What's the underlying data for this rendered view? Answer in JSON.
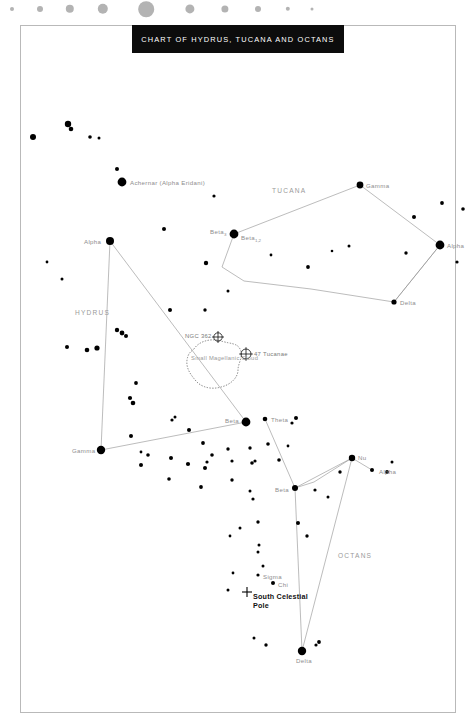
{
  "chart_data": {
    "type": "scatter",
    "title": "CHART OF HYDRUS, TUCANA AND OCTANS",
    "subtitle": "",
    "xlabel": "",
    "ylabel": "",
    "grid": false,
    "legend_position": "top",
    "magnitude_key": {
      "name": "star-magnitude-key",
      "color": "#b3b3b3",
      "dot_radii": [
        2.0,
        3.0,
        4.2,
        5.2,
        7.8,
        4.6,
        3.6,
        3.0,
        2.2,
        1.5
      ],
      "dot_x": [
        12,
        40,
        70,
        103,
        146,
        190,
        225,
        258,
        288,
        312
      ]
    },
    "constellations": [
      {
        "name": "HYDRUS",
        "label_x": 75,
        "label_y": 310
      },
      {
        "name": "TUCANA",
        "label_x": 272,
        "label_y": 188
      },
      {
        "name": "OCTANS",
        "label_x": 338,
        "label_y": 553
      }
    ],
    "named_stars": [
      {
        "label": "Achernar (Alpha Eridani)",
        "x": 122,
        "y": 182,
        "r": 4.4,
        "label_dx": 8,
        "label_dy": -2.5,
        "constellation": "Eridanus"
      },
      {
        "label": "Alpha",
        "x": 110,
        "y": 241,
        "r": 4.0,
        "label_dx": -26,
        "label_dy": -2.5,
        "constellation": "Hydrus"
      },
      {
        "label": "Gamma",
        "x": 101,
        "y": 450,
        "r": 4.2,
        "label_dx": -29,
        "label_dy": -2.5,
        "constellation": "Hydrus"
      },
      {
        "label": "Beta",
        "x": 246,
        "y": 422,
        "r": 4.4,
        "label_dx": -21,
        "label_dy": -4.0,
        "constellation": "Hydrus"
      },
      {
        "label": "Gamma",
        "x": 360,
        "y": 185,
        "r": 3.4,
        "label_dx": 6,
        "label_dy": -2.5,
        "constellation": "Tucana"
      },
      {
        "label": "Alpha",
        "x": 440,
        "y": 245,
        "r": 4.4,
        "label_dx": 7,
        "label_dy": -2.5,
        "constellation": "Tucana"
      },
      {
        "label": "Delta",
        "x": 394,
        "y": 302,
        "r": 2.6,
        "label_dx": 6,
        "label_dy": -2.0,
        "constellation": "Tucana"
      },
      {
        "label": "Beta",
        "sub": "3",
        "x": 234,
        "y": 234,
        "r": 4.4,
        "label_dx": -24,
        "label_dy": -5.0,
        "constellation": "Tucana"
      },
      {
        "label": "Beta",
        "sub": "1,2",
        "x": 234,
        "y": 234,
        "r": 0,
        "label_dx": 7,
        "label_dy": 1.0,
        "constellation": "Tucana"
      },
      {
        "label": "Theta",
        "x": 265,
        "y": 419,
        "r": 2.3,
        "label_dx": 6,
        "label_dy": -2.0,
        "constellation": "Octans"
      },
      {
        "label": "Beta",
        "x": 295,
        "y": 488,
        "r": 3.0,
        "label_dx": -20,
        "label_dy": -1.5,
        "constellation": "Octans"
      },
      {
        "label": "Nu",
        "x": 352,
        "y": 458,
        "r": 3.2,
        "label_dx": 6,
        "label_dy": -3.5,
        "constellation": "Octans"
      },
      {
        "label": "Alpha",
        "x": 372,
        "y": 470,
        "r": 2.0,
        "label_dx": 7,
        "label_dy": -1.5,
        "constellation": "Octans"
      },
      {
        "label": "Delta",
        "x": 302,
        "y": 651,
        "r": 4.2,
        "label_dx": -6,
        "label_dy": 7.0,
        "constellation": "Octans"
      },
      {
        "label": "Sigma",
        "x": 258,
        "y": 575,
        "r": 1.6,
        "label_dx": 5,
        "label_dy": -1.5,
        "constellation": "Octans"
      },
      {
        "label": "Chi",
        "x": 273,
        "y": 583,
        "r": 2.0,
        "label_dx": 5,
        "label_dy": -1.0,
        "constellation": "Octans"
      }
    ],
    "deep_sky_objects": [
      {
        "label": "NGC 362",
        "x": 218,
        "y": 337,
        "symbol": "circle-cross",
        "r": 4.2,
        "label_dx": -33,
        "label_dy": -3.0
      },
      {
        "label": "47 Tucanae",
        "x": 246,
        "y": 354,
        "symbol": "circle-cross",
        "r": 5.0,
        "label_dx": 8,
        "label_dy": -2.5
      },
      {
        "label": "Small Magellanic Cloud",
        "x": 212,
        "y": 364,
        "symbol": "dotted-outline",
        "label_dx": -21,
        "label_dy": -10
      }
    ],
    "pole_marker": {
      "label": "South Celestial Pole",
      "x": 247,
      "y": 592,
      "symbol": "plus-cross",
      "label_dx": 6,
      "label_dy": 0
    },
    "constellation_lines": [
      {
        "constellation": "Hydrus",
        "points": [
          [
            110,
            241
          ],
          [
            101,
            450
          ],
          [
            246,
            422
          ],
          [
            110,
            241
          ]
        ]
      },
      {
        "constellation": "Tucana",
        "points": [
          [
            234,
            234
          ],
          [
            360,
            185
          ],
          [
            440,
            245
          ],
          [
            394,
            302
          ],
          [
            311,
            289
          ],
          [
            244,
            281
          ],
          [
            222,
            267
          ],
          [
            234,
            234
          ]
        ]
      },
      {
        "constellation": "Tucana-delta-alpha",
        "points": [
          [
            394,
            302
          ],
          [
            440,
            245
          ]
        ]
      },
      {
        "constellation": "Octans",
        "points": [
          [
            265,
            419
          ],
          [
            295,
            488
          ],
          [
            352,
            458
          ],
          [
            302,
            651
          ],
          [
            295,
            488
          ]
        ]
      },
      {
        "constellation": "Octans-nu-alpha",
        "points": [
          [
            352,
            458
          ],
          [
            372,
            470
          ]
        ]
      },
      {
        "constellation": "Octans-beta-chain",
        "points": [
          [
            295,
            488
          ],
          [
            314,
            482
          ],
          [
            352,
            458
          ]
        ]
      }
    ],
    "field_stars": [
      [
        33,
        137,
        3.0
      ],
      [
        68,
        124,
        3.2
      ],
      [
        71,
        129,
        2.3
      ],
      [
        90,
        137,
        1.8
      ],
      [
        99,
        138,
        1.5
      ],
      [
        117,
        169,
        2.0
      ],
      [
        164,
        229,
        2.0
      ],
      [
        206,
        263,
        2.2
      ],
      [
        170,
        310,
        2.0
      ],
      [
        97,
        348,
        2.6
      ],
      [
        117,
        330,
        2.2
      ],
      [
        122,
        333,
        2.4
      ],
      [
        126,
        336,
        2.0
      ],
      [
        67,
        347,
        2.0
      ],
      [
        87,
        350,
        2.3
      ],
      [
        136,
        383,
        1.9
      ],
      [
        130,
        398,
        2.1
      ],
      [
        133,
        403,
        2.3
      ],
      [
        131,
        436,
        2.0
      ],
      [
        141,
        452,
        1.4
      ],
      [
        148,
        455,
        1.8
      ],
      [
        172,
        420,
        1.6
      ],
      [
        175,
        417,
        1.5
      ],
      [
        189,
        430,
        2.0
      ],
      [
        203,
        443,
        1.9
      ],
      [
        141,
        465,
        2.0
      ],
      [
        171,
        458,
        2.0
      ],
      [
        188,
        464,
        2.1
      ],
      [
        205,
        468,
        2.0
      ],
      [
        212,
        455,
        1.8
      ],
      [
        207,
        462,
        1.6
      ],
      [
        201,
        487,
        1.9
      ],
      [
        169,
        479,
        1.8
      ],
      [
        228,
        449,
        1.7
      ],
      [
        232,
        461,
        1.6
      ],
      [
        250,
        448,
        1.7
      ],
      [
        255,
        461,
        1.6
      ],
      [
        232,
        480,
        1.7
      ],
      [
        250,
        491,
        1.5
      ],
      [
        268,
        444,
        1.8
      ],
      [
        279,
        460,
        1.8
      ],
      [
        258,
        522,
        1.7
      ],
      [
        240,
        528,
        1.5
      ],
      [
        298,
        523,
        2.0
      ],
      [
        307,
        536,
        1.7
      ],
      [
        258,
        552,
        1.5
      ],
      [
        230,
        536,
        1.4
      ],
      [
        253,
        499,
        1.6
      ],
      [
        263,
        566,
        1.5
      ],
      [
        315,
        490,
        1.6
      ],
      [
        328,
        497,
        1.5
      ],
      [
        252,
        463,
        1.8
      ],
      [
        259,
        545,
        1.5
      ],
      [
        228,
        590,
        1.5
      ],
      [
        233,
        573,
        1.4
      ],
      [
        254,
        638,
        1.5
      ],
      [
        266,
        645,
        1.7
      ],
      [
        316,
        645,
        1.6
      ],
      [
        319,
        642,
        1.9
      ],
      [
        340,
        472,
        1.7
      ],
      [
        387,
        472,
        1.9
      ],
      [
        392,
        462,
        1.5
      ],
      [
        406,
        253,
        1.7
      ],
      [
        414,
        217,
        2.0
      ],
      [
        442,
        203,
        1.9
      ],
      [
        349,
        246,
        1.5
      ],
      [
        332,
        251,
        1.3
      ],
      [
        308,
        267,
        1.9
      ],
      [
        271,
        255,
        1.4
      ],
      [
        457,
        262,
        1.6
      ],
      [
        463,
        209,
        1.8
      ],
      [
        214,
        196,
        1.6
      ],
      [
        228,
        291,
        1.5
      ],
      [
        205,
        310,
        1.7
      ],
      [
        62,
        279,
        1.5
      ],
      [
        47,
        262,
        1.4
      ],
      [
        296,
        418,
        2.0
      ],
      [
        292,
        423,
        1.6
      ],
      [
        288,
        446,
        1.4
      ]
    ]
  }
}
